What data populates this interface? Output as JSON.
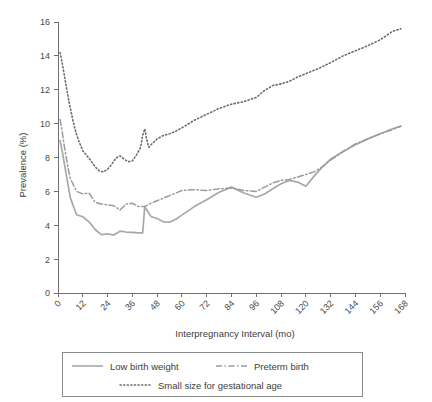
{
  "chart_data": {
    "type": "line",
    "title": "",
    "subtitle": "",
    "xlabel": "Interpregnancy Interval (mo)",
    "ylabel": "Prevalence (%)",
    "xlim": [
      0,
      168
    ],
    "ylim": [
      0,
      16
    ],
    "xticks": [
      0,
      12,
      24,
      36,
      48,
      60,
      72,
      84,
      96,
      108,
      120,
      132,
      144,
      156,
      168
    ],
    "yticks": [
      0,
      2,
      4,
      6,
      8,
      10,
      12,
      14,
      16
    ],
    "xtick_labels": [
      "0",
      "12",
      "24",
      "36",
      "48",
      "60",
      "72",
      "84",
      "96",
      "108",
      "120",
      "132",
      "144",
      "156",
      "168"
    ],
    "ytick_labels": [
      "0",
      "2",
      "4",
      "6",
      "8",
      "10",
      "12",
      "14",
      "16"
    ],
    "grid": false,
    "legend_position": "bottom",
    "xtick_label_rotation": -45,
    "series": [
      {
        "name": "Low birth weight",
        "style": "solid",
        "color": "#a8a8a8",
        "x": [
          1,
          2,
          3,
          4,
          5,
          6,
          9,
          12,
          15,
          18,
          21,
          24,
          27,
          30,
          33,
          36,
          39,
          41,
          42,
          45,
          48,
          51,
          54,
          57,
          60,
          66,
          72,
          78,
          84,
          90,
          96,
          100,
          104,
          108,
          112,
          116,
          120,
          124,
          128,
          132,
          138,
          144,
          150,
          156,
          162,
          166
        ],
        "y": [
          9.0,
          8.4,
          7.7,
          7.0,
          6.3,
          5.6,
          4.62,
          4.5,
          4.2,
          3.75,
          3.45,
          3.5,
          3.42,
          3.65,
          3.6,
          3.58,
          3.55,
          3.55,
          5.1,
          4.52,
          4.4,
          4.2,
          4.18,
          4.35,
          4.6,
          5.1,
          5.5,
          5.95,
          6.25,
          5.9,
          5.65,
          5.85,
          6.15,
          6.45,
          6.65,
          6.55,
          6.3,
          6.9,
          7.45,
          7.9,
          8.35,
          8.75,
          9.1,
          9.4,
          9.7,
          9.85
        ]
      },
      {
        "name": "Preterm birth",
        "style": "dashdot",
        "color": "#9b9b9b",
        "x": [
          1,
          2,
          3,
          4,
          5,
          6,
          9,
          12,
          15,
          18,
          21,
          24,
          27,
          30,
          33,
          36,
          39,
          42,
          45,
          48,
          51,
          54,
          57,
          60,
          66,
          72,
          78,
          84,
          90,
          96,
          100,
          104,
          108,
          112,
          116,
          120,
          124,
          128,
          132,
          138,
          144,
          150,
          156,
          162,
          166
        ],
        "y": [
          10.25,
          9.55,
          8.7,
          8.0,
          7.3,
          6.75,
          6.0,
          5.85,
          5.9,
          5.35,
          5.25,
          5.2,
          5.15,
          4.9,
          5.25,
          5.3,
          5.1,
          5.1,
          5.3,
          5.45,
          5.6,
          5.75,
          5.9,
          6.05,
          6.1,
          6.05,
          6.15,
          6.2,
          6.05,
          6.0,
          6.25,
          6.5,
          6.65,
          6.7,
          6.85,
          7.0,
          7.15,
          7.45,
          7.85,
          8.35,
          8.8,
          9.1,
          9.4,
          9.65,
          9.85
        ]
      },
      {
        "name": "Small size for gestational age",
        "style": "dotted",
        "color": "#6b6b6b",
        "x": [
          1,
          2,
          3,
          4,
          5,
          6,
          7,
          8,
          9,
          10,
          12,
          14,
          16,
          18,
          20,
          22,
          24,
          26,
          28,
          30,
          32,
          34,
          36,
          38,
          40,
          41,
          42,
          43,
          44,
          45,
          48,
          51,
          54,
          57,
          60,
          66,
          72,
          78,
          84,
          90,
          96,
          100,
          104,
          108,
          112,
          116,
          120,
          126,
          132,
          138,
          144,
          150,
          156,
          162,
          166
        ],
        "y": [
          14.2,
          13.6,
          12.9,
          12.2,
          11.5,
          10.9,
          10.3,
          9.8,
          9.35,
          9.0,
          8.4,
          8.1,
          7.8,
          7.45,
          7.2,
          7.15,
          7.3,
          7.6,
          7.95,
          8.1,
          7.9,
          7.75,
          7.8,
          8.15,
          8.6,
          9.3,
          9.7,
          9.05,
          8.6,
          8.75,
          9.1,
          9.3,
          9.4,
          9.55,
          9.75,
          10.2,
          10.55,
          10.9,
          11.15,
          11.3,
          11.55,
          11.95,
          12.25,
          12.35,
          12.5,
          12.75,
          12.95,
          13.25,
          13.6,
          14.0,
          14.3,
          14.6,
          14.95,
          15.45,
          15.6
        ]
      }
    ]
  },
  "legend": {
    "items": [
      {
        "label": "Low birth weight",
        "style": "solid"
      },
      {
        "label": "Preterm birth",
        "style": "dashdot"
      },
      {
        "label": "Small size for gestational age",
        "style": "dotted"
      }
    ]
  },
  "axes": {
    "x_title": "Interpregnancy Interval (mo)",
    "y_title": "Prevalence (%)"
  }
}
